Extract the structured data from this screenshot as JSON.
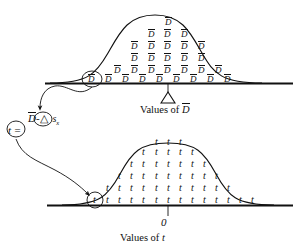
{
  "diagram": {
    "top_panel": {
      "name": "sampling-distribution-of-dbar",
      "axis_label_prefix": "Values of",
      "axis_label_symbol": "D",
      "axis_label_has_overbar": true,
      "center_marker": "triangle",
      "center_marker_meaning": "delta",
      "glyph": "D",
      "glyph_has_overbar": true,
      "circled_glyph": "D",
      "circled_glyph_has_overbar": true,
      "rows": [
        1,
        3,
        5,
        5,
        7,
        9
      ]
    },
    "formula": {
      "name": "t-statistic",
      "lhs": "t",
      "equals": "=",
      "numerator_left": "D",
      "numerator_left_has_overbar": true,
      "numerator_minus": "-",
      "numerator_right": "△",
      "denominator": "s",
      "denominator_subscript": "x"
    },
    "bottom_panel": {
      "name": "t-distribution",
      "axis_label_prefix": "Values of",
      "axis_label_symbol": "t",
      "center_tick_label": "0",
      "glyph": "t",
      "circled_glyph": "t",
      "columns": [
        1,
        2,
        3,
        4,
        5,
        6,
        6,
        6,
        5,
        4,
        3,
        2,
        1
      ]
    },
    "colors": {
      "ink": "#111111",
      "background": "#ffffff"
    }
  }
}
